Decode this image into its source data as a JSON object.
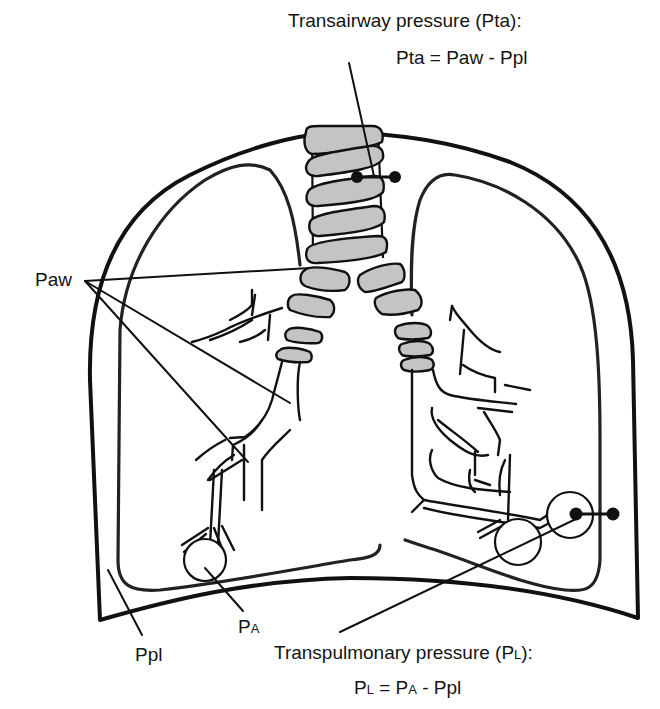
{
  "labels": {
    "transairway_title": "Transairway pressure (Pta):",
    "transairway_formula": "Pta = Paw - Ppl",
    "paw": "Paw",
    "ppl": "Ppl",
    "pa_main": "P",
    "pa_sub": "A",
    "transpulmonary_title_main": "Transpulmonary pressure (P",
    "transpulmonary_title_sub": "L",
    "transpulmonary_title_end": "):",
    "transpulmonary_formula": {
      "pl_main": "P",
      "pl_sub": "L",
      "eq": " = P",
      "pa_sub": "A",
      "rest": " - Ppl"
    }
  },
  "colors": {
    "line": "#111111",
    "cartilage_fill": "#c4c4c4",
    "background": "#ffffff"
  }
}
